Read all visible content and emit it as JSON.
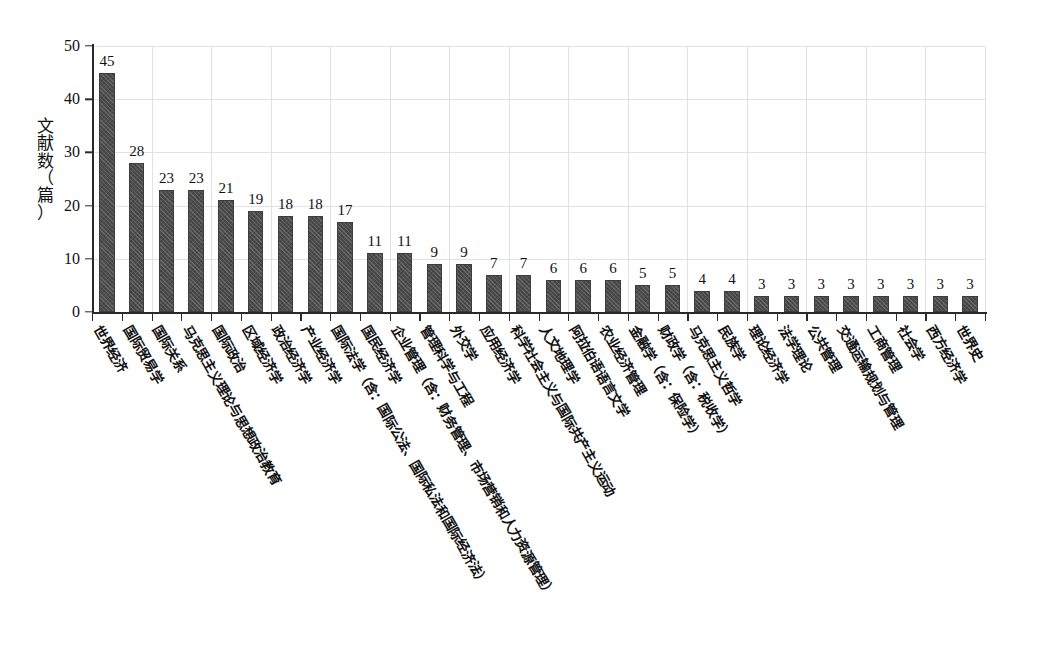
{
  "chart_data": {
    "type": "bar",
    "title": "",
    "subtitle": "",
    "xlabel": "",
    "ylabel": "文献数（篇）",
    "ylim": [
      0,
      50
    ],
    "yticks": [
      0,
      10,
      20,
      30,
      40,
      50
    ],
    "grid": true,
    "legend": false,
    "bar_color": "#4c4c4c",
    "grid_color": "#e2e2e6",
    "axis_color": "#2a2a2a",
    "categories": [
      "世界经济",
      "国际贸易学",
      "国际关系",
      "马克思主义理论与思想政治教育",
      "国际政治",
      "区域经济学",
      "政治经济学",
      "产业经济学",
      "国际法学（含：国际公法、国际私法和国际经济法）",
      "国民经济学",
      "企业管理（含：财务管理、市场营销和人力资源管理）",
      "管理科学与工程",
      "外交学",
      "应用经济学",
      "科学社会主义与国际共产主义运动",
      "人文地理学",
      "阿拉伯语语言文学",
      "农业经济管理",
      "金融学（含：保险学）",
      "财政学（含：税收学）",
      "马克思主义哲学",
      "民族学",
      "理论经济学",
      "法学理论",
      "公共管理",
      "交通运输规划与管理",
      "工商管理",
      "社会学",
      "西方经济学",
      "世界史"
    ],
    "values": [
      45,
      28,
      23,
      23,
      21,
      19,
      18,
      18,
      17,
      11,
      11,
      9,
      9,
      7,
      7,
      6,
      6,
      6,
      5,
      5,
      4,
      4,
      3,
      3,
      3,
      3,
      3,
      3,
      3,
      3
    ],
    "ylabel_chars": [
      "文",
      "献",
      "数",
      "（",
      "篇",
      "）"
    ]
  }
}
